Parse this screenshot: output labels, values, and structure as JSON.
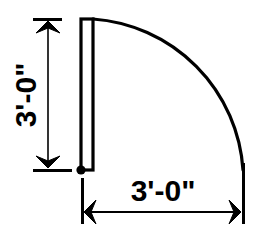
{
  "drawing": {
    "type": "architectural-door-swing-plan",
    "title": "Door swing plan detail",
    "canvas": {
      "width": 258,
      "height": 242
    },
    "colors": {
      "background": "#ffffff",
      "line": "#000000",
      "text": "#000000"
    },
    "door_panel": {
      "name": "door-leaf",
      "hinge_point": {
        "x": 81,
        "y": 170
      },
      "top_point": {
        "x": 81,
        "y": 19
      },
      "thickness_px": 12,
      "length_px": 151
    },
    "swing_arc": {
      "name": "door-swing-arc",
      "center": {
        "x": 81,
        "y": 170
      },
      "radius_px": 162,
      "sweep_degrees": 90,
      "start_point": {
        "x": 93,
        "y": 19
      },
      "end_point": {
        "x": 243,
        "y": 170
      }
    },
    "dimensions": [
      {
        "id": "vertical-dimension",
        "label": "3'-0\"",
        "orientation": "vertical",
        "rotation_degrees": -90,
        "measures": "door leaf opening height",
        "line_x": 48,
        "from_y": 19,
        "to_y": 170,
        "arrow_style": "double-barb-outward",
        "text_position": {
          "x": 30,
          "y": 95
        }
      },
      {
        "id": "horizontal-dimension",
        "label": "3'-0\"",
        "orientation": "horizontal",
        "rotation_degrees": 0,
        "measures": "door swing radius",
        "line_y": 212,
        "from_x": 82,
        "to_x": 243,
        "arrow_style": "double-barb-outward",
        "text_position": {
          "x": 163,
          "y": 190
        }
      }
    ]
  }
}
